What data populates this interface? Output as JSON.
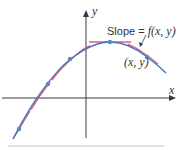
{
  "diagram": {
    "axes": {
      "x_label": "x",
      "y_label": "y",
      "axis_color": "#3a3a3a"
    },
    "annotations": {
      "slope_prefix": "Slope = ",
      "slope_func": "f(x, y)",
      "point_label": "(x, y)"
    },
    "colors": {
      "curve": "#4a74b8",
      "tangent": "#d9607a",
      "dot": "#5b86c8",
      "divider": "#bfc4c9"
    },
    "points": [
      {
        "x": 19,
        "y": 129
      },
      {
        "x": 48,
        "y": 84
      },
      {
        "x": 70,
        "y": 59
      },
      {
        "x": 110,
        "y": 42
      },
      {
        "x": 147,
        "y": 57
      }
    ]
  }
}
